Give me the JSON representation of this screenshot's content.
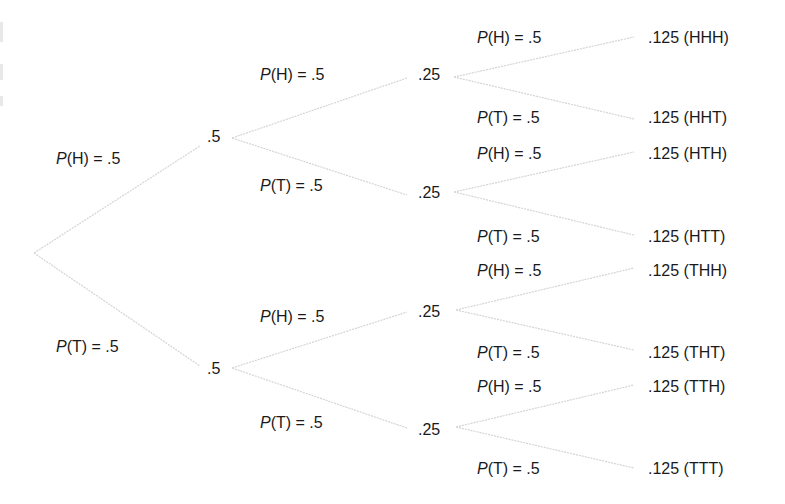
{
  "diagram": {
    "type": "probability-tree",
    "colors": {
      "text": "#1a1a1a",
      "branch": "#d4d4d4",
      "background": "#ffffff"
    },
    "root": {
      "x": 34,
      "y": 253
    },
    "level1": [
      {
        "id": "H",
        "node_label": ".5",
        "node_pos": {
          "x": 207,
          "y": 128
        },
        "join": {
          "x": 200,
          "y": 146
        },
        "out": {
          "x": 232,
          "y": 138
        },
        "branch_label": {
          "var": "P",
          "rest": "(H) = .5",
          "x": 56,
          "y": 150
        }
      },
      {
        "id": "T",
        "node_label": ".5",
        "node_pos": {
          "x": 207,
          "y": 360
        },
        "join": {
          "x": 200,
          "y": 366
        },
        "out": {
          "x": 232,
          "y": 368
        },
        "branch_label": {
          "var": "P",
          "rest": "(T) = .5",
          "x": 56,
          "y": 338
        }
      }
    ],
    "level2": [
      {
        "id": "HH",
        "parent": 0,
        "node_label": ".25",
        "node_pos": {
          "x": 418,
          "y": 66
        },
        "join": {
          "x": 407,
          "y": 78
        },
        "out": {
          "x": 454,
          "y": 77
        },
        "branch_label": {
          "var": "P",
          "rest": "(H) = .5",
          "x": 260,
          "y": 66
        }
      },
      {
        "id": "HT",
        "parent": 0,
        "node_label": ".25",
        "node_pos": {
          "x": 418,
          "y": 184
        },
        "join": {
          "x": 407,
          "y": 195
        },
        "out": {
          "x": 454,
          "y": 192
        },
        "branch_label": {
          "var": "P",
          "rest": "(T) = .5",
          "x": 260,
          "y": 177
        }
      },
      {
        "id": "TH",
        "parent": 1,
        "node_label": ".25",
        "node_pos": {
          "x": 418,
          "y": 303
        },
        "join": {
          "x": 407,
          "y": 312
        },
        "out": {
          "x": 456,
          "y": 310
        },
        "branch_label": {
          "var": "P",
          "rest": "(H) = .5",
          "x": 260,
          "y": 308
        }
      },
      {
        "id": "TT",
        "parent": 1,
        "node_label": ".25",
        "node_pos": {
          "x": 418,
          "y": 421
        },
        "join": {
          "x": 407,
          "y": 428
        },
        "out": {
          "x": 456,
          "y": 427
        },
        "branch_label": {
          "var": "P",
          "rest": "(T) = .5",
          "x": 260,
          "y": 414
        }
      }
    ],
    "leaves": [
      {
        "parent": 0,
        "label": ".125 (HHH)",
        "x": 648,
        "y": 29,
        "join": {
          "x": 634,
          "y": 37
        },
        "branch_label": {
          "var": "P",
          "rest": "(H) = .5",
          "x": 477,
          "y": 29
        }
      },
      {
        "parent": 0,
        "label": ".125 (HHT)",
        "x": 648,
        "y": 109,
        "join": {
          "x": 634,
          "y": 119
        },
        "branch_label": {
          "var": "P",
          "rest": "(T) = .5",
          "x": 477,
          "y": 109
        }
      },
      {
        "parent": 1,
        "label": ".125 (HTH)",
        "x": 648,
        "y": 145,
        "join": {
          "x": 634,
          "y": 152
        },
        "branch_label": {
          "var": "P",
          "rest": "(H) = .5",
          "x": 477,
          "y": 145
        }
      },
      {
        "parent": 1,
        "label": ".125 (HTT)",
        "x": 648,
        "y": 228,
        "join": {
          "x": 634,
          "y": 235
        },
        "branch_label": {
          "var": "P",
          "rest": "(T) = .5",
          "x": 477,
          "y": 228
        }
      },
      {
        "parent": 2,
        "label": ".125 (THH)",
        "x": 648,
        "y": 262,
        "join": {
          "x": 634,
          "y": 268
        },
        "branch_label": {
          "var": "P",
          "rest": "(H) = .5",
          "x": 477,
          "y": 262
        }
      },
      {
        "parent": 2,
        "label": ".125 (THT)",
        "x": 648,
        "y": 344,
        "join": {
          "x": 634,
          "y": 350
        },
        "branch_label": {
          "var": "P",
          "rest": "(T) = .5",
          "x": 477,
          "y": 344
        }
      },
      {
        "parent": 3,
        "label": ".125 (TTH)",
        "x": 648,
        "y": 378,
        "join": {
          "x": 634,
          "y": 385
        },
        "branch_label": {
          "var": "P",
          "rest": "(H) = .5",
          "x": 477,
          "y": 378
        }
      },
      {
        "parent": 3,
        "label": ".125 (TTT)",
        "x": 648,
        "y": 460,
        "join": {
          "x": 634,
          "y": 468
        },
        "branch_label": {
          "var": "P",
          "rest": "(T) = .5",
          "x": 477,
          "y": 460
        }
      }
    ]
  }
}
